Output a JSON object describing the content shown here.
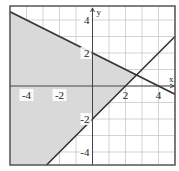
{
  "chart_data": {
    "type": "line",
    "title": "",
    "xlabel": "x",
    "ylabel": "y",
    "xlim": [
      -5,
      5
    ],
    "ylim": [
      -4.8,
      4.8
    ],
    "grid": true,
    "x_ticks": [
      -4,
      -2,
      2,
      4
    ],
    "y_ticks": [
      4,
      2,
      -2,
      -4
    ],
    "x_tick_labels": [
      "-4",
      "-2",
      "2",
      "4"
    ],
    "y_tick_labels": [
      "4",
      "2",
      "-2",
      "-4"
    ],
    "series": [
      {
        "name": "boundary-1",
        "equation": "y = -x/2 + 2",
        "points": [
          [
            -5,
            4.5
          ],
          [
            5,
            -0.5
          ]
        ]
      },
      {
        "name": "boundary-2",
        "equation": "y = x - 2",
        "points": [
          [
            -2.8,
            -4.8
          ],
          [
            5,
            3
          ]
        ]
      }
    ],
    "shaded_region": {
      "description": "y <= -x/2 + 2 and y >= x - 2",
      "vertices": [
        [
          -5,
          4.5
        ],
        [
          2.667,
          0.667
        ],
        [
          -2.8,
          -4.8
        ],
        [
          -5,
          -4.8
        ]
      ],
      "fill_color": "#d9d9d9"
    },
    "intersection": [
      2.667,
      0.667
    ],
    "colors": {
      "line": "#333333",
      "grid": "#c8c8c8",
      "shade": "#d9d9d9",
      "frame": "#555555"
    }
  }
}
